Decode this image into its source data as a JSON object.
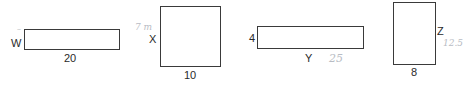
{
  "shapes": [
    {
      "id": "rect-1",
      "width_label": "20",
      "height_label": "W",
      "width_value": 20,
      "height_value": "W"
    },
    {
      "id": "rect-2",
      "width_label": "10",
      "height_label": "X",
      "width_value": 10,
      "height_value": "X",
      "handwritten_note": "7 m"
    },
    {
      "id": "rect-3",
      "width_label": "Y",
      "height_label": "4",
      "width_value": "Y",
      "height_value": 4,
      "handwritten_note": "25"
    },
    {
      "id": "rect-4",
      "width_label": "8",
      "height_label": "Z",
      "width_value": 8,
      "height_value": "Z",
      "handwritten_note": "12.5"
    }
  ],
  "annotations": {
    "w_mark": "~"
  }
}
